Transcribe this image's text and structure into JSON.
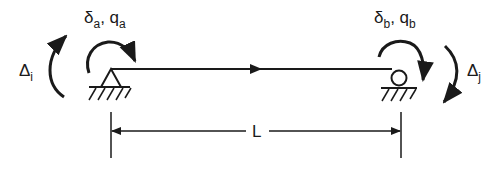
{
  "diagram": {
    "title": "",
    "type": "beam-element",
    "colors": {
      "stroke": "#1a1a1a",
      "background": "#ffffff"
    },
    "labels": {
      "left_end": {
        "sym1": "δ",
        "sub1": "a",
        "sep": ", ",
        "sym2": "q",
        "sub2": "a"
      },
      "right_end": {
        "sym1": "δ",
        "sub1": "b",
        "sep": ", ",
        "sym2": "q",
        "sub2": "b"
      },
      "left_rotation": {
        "sym": "Δ",
        "sub": "i"
      },
      "right_rotation": {
        "sym": "Δ",
        "sub": "j"
      },
      "length": "L"
    },
    "supports": {
      "left": "pin",
      "right": "roller"
    }
  }
}
